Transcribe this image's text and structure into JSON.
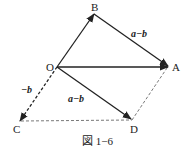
{
  "figure": {
    "caption": "図 1−6",
    "points": {
      "O": {
        "label": "O",
        "x": 57,
        "y": 67
      },
      "A": {
        "label": "A",
        "x": 168,
        "y": 67
      },
      "B": {
        "label": "B",
        "x": 94,
        "y": 13
      },
      "C": {
        "label": "C",
        "x": 20,
        "y": 121
      },
      "D": {
        "label": "D",
        "x": 132,
        "y": 120
      }
    },
    "vectors": [
      {
        "from": "O",
        "to": "B",
        "style": "solid",
        "arrow": true
      },
      {
        "from": "O",
        "to": "A",
        "style": "solid",
        "arrow": true
      },
      {
        "from": "B",
        "to": "A",
        "style": "solid",
        "arrow": true,
        "label": "a−b"
      },
      {
        "from": "O",
        "to": "D",
        "style": "solid",
        "arrow": true,
        "label": "a−b"
      },
      {
        "from": "O",
        "to": "C",
        "style": "dashed",
        "arrow": true,
        "label": "−b"
      },
      {
        "from": "C",
        "to": "D",
        "style": "dashed",
        "arrow": false
      },
      {
        "from": "D",
        "to": "A",
        "style": "dashed",
        "arrow": false
      }
    ],
    "labels": {
      "ba": "a−b",
      "od": "a−b",
      "oc": "−b"
    },
    "colors": {
      "stroke": "#222222",
      "background": "#ffffff"
    }
  }
}
